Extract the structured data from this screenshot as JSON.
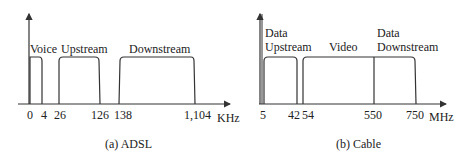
{
  "panels": [
    {
      "caption": "(a) ADSL",
      "unit": "KHz",
      "ticks": [
        "0",
        "4",
        "26",
        "126",
        "138",
        "1,104"
      ],
      "bands": [
        "Voice",
        "Upstream",
        "Downstream"
      ]
    },
    {
      "caption": "(b) Cable",
      "unit": "MHz",
      "ticks": [
        "5",
        "42",
        "54",
        "550",
        "750"
      ],
      "bands": [
        "Data",
        "Upstream",
        "Video",
        "Data",
        "Downstream"
      ]
    }
  ]
}
